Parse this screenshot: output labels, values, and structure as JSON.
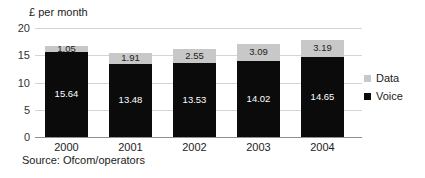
{
  "chart_data": {
    "type": "bar",
    "stacked": true,
    "title": "£ per month",
    "categories": [
      "2000",
      "2001",
      "2002",
      "2003",
      "2004"
    ],
    "series": [
      {
        "name": "Voice",
        "color": "#0b0b0b",
        "label_color": "#ffffff",
        "values": [
          15.64,
          13.48,
          13.53,
          14.02,
          14.65
        ]
      },
      {
        "name": "Data",
        "color": "#c8c8c8",
        "label_color": "#1c1c1c",
        "values": [
          1.05,
          1.91,
          2.55,
          3.09,
          3.19
        ]
      }
    ],
    "ylim": [
      0,
      20
    ],
    "yticks": [
      0,
      5,
      10,
      15,
      20
    ],
    "grid": true,
    "legend_position": "right",
    "gridline_color": "#d4d4d4",
    "baseline_color": "#8f8f8f"
  },
  "legend": {
    "items": [
      {
        "label": "Data",
        "color": "#c8c8c8"
      },
      {
        "label": "Voice",
        "color": "#0b0b0b"
      }
    ]
  },
  "source": "Source: Ofcom/operators"
}
